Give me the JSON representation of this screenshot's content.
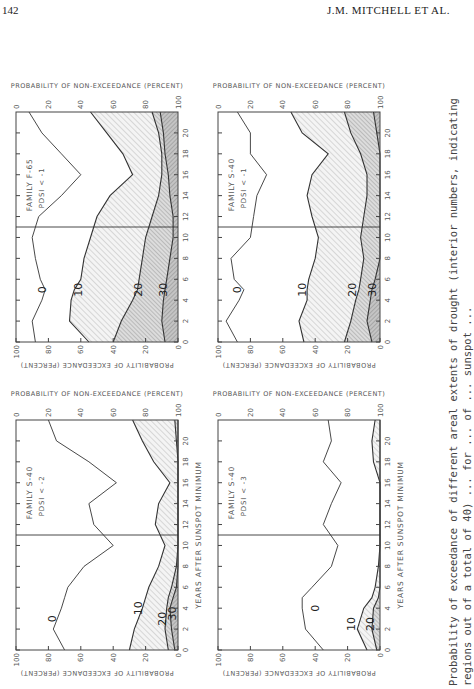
{
  "page": {
    "number": "142",
    "running_head": "J.M. MITCHELL ET AL."
  },
  "caption": {
    "line1": "Probability of exceedance of different areal extents of drought (interior numbers, indicating",
    "line2": "regions out of a total of 40) ... for ... of ... sunspot ..."
  },
  "axes": {
    "x_label": "YEARS AFTER SUNSPOT MINIMUM",
    "y_left_label": "PROBABILITY OF EXCEEDANCE (PERCENT)",
    "y_right_label": "PROBABILITY OF NON-EXCEEDANCE (PERCENT)"
  },
  "chart_data": [
    {
      "type": "area",
      "title": "FAMILY F-65",
      "subtitle": "PDSI < -1",
      "position": "top-left",
      "xlabel": "YEARS AFTER SUNSPOT MINIMUM",
      "ylabel": "PROBABILITY OF EXCEEDANCE (PERCENT)",
      "y2label": "PROBABILITY OF NON-EXCEEDANCE (PERCENT)",
      "xlim": [
        0,
        22
      ],
      "ylim": [
        0,
        100
      ],
      "xticks": [
        0,
        2,
        4,
        6,
        8,
        10,
        12,
        14,
        16,
        18,
        20
      ],
      "yticks": [
        0,
        20,
        40,
        60,
        80,
        100
      ],
      "vline_x": 11,
      "x": [
        0,
        2,
        4,
        5,
        6,
        8,
        10,
        12,
        14,
        16,
        18,
        20,
        22
      ],
      "series": [
        {
          "name": "0",
          "label_at": [
            5,
            84
          ],
          "values": [
            88,
            90,
            84,
            82,
            85,
            88,
            90,
            86,
            72,
            60,
            72,
            84,
            92
          ]
        },
        {
          "name": "10",
          "label_at": [
            5,
            62
          ],
          "values": [
            55,
            67,
            66,
            64,
            60,
            58,
            54,
            50,
            42,
            28,
            34,
            44,
            54
          ]
        },
        {
          "name": "20",
          "label_at": [
            5,
            25
          ],
          "values": [
            40,
            35,
            28,
            25,
            24,
            22,
            20,
            16,
            12,
            10,
            10,
            12,
            16
          ]
        },
        {
          "name": "30",
          "label_at": [
            5,
            9
          ],
          "values": [
            8,
            10,
            9,
            8,
            7,
            5,
            3,
            3,
            5,
            6,
            8,
            9,
            11
          ]
        }
      ]
    },
    {
      "type": "area",
      "title": "FAMILY S-40",
      "subtitle": "PDSI < -1",
      "position": "top-right",
      "xlabel": "YEARS AFTER SUNSPOT MINIMUM",
      "ylabel": "PROBABILITY OF EXCEEDANCE (PERCENT)",
      "y2label": "PROBABILITY OF NON-EXCEEDANCE (PERCENT)",
      "xlim": [
        0,
        22
      ],
      "ylim": [
        0,
        100
      ],
      "xticks": [
        0,
        2,
        4,
        6,
        8,
        10,
        12,
        14,
        16,
        18,
        20
      ],
      "yticks": [
        0,
        20,
        40,
        60,
        80,
        100
      ],
      "vline_x": 11,
      "x": [
        0,
        2,
        4,
        5,
        6,
        8,
        10,
        12,
        14,
        16,
        18,
        20,
        22
      ],
      "series": [
        {
          "name": "0",
          "label_at": [
            5,
            88
          ],
          "values": [
            88,
            95,
            87,
            84,
            90,
            92,
            80,
            78,
            76,
            70,
            80,
            80,
            88
          ]
        },
        {
          "name": "10",
          "label_at": [
            5,
            48
          ],
          "values": [
            47,
            50,
            45,
            45,
            44,
            40,
            38,
            42,
            45,
            42,
            32,
            48,
            55
          ]
        },
        {
          "name": "20",
          "label_at": [
            5,
            17
          ],
          "values": [
            22,
            18,
            15,
            13,
            12,
            10,
            12,
            10,
            8,
            8,
            12,
            18,
            22
          ]
        },
        {
          "name": "30",
          "label_at": [
            5,
            5
          ],
          "values": [
            5,
            8,
            6,
            5,
            3,
            0,
            0,
            0,
            0,
            0,
            0,
            2,
            4
          ]
        }
      ]
    },
    {
      "type": "area",
      "title": "FAMILY S-40",
      "subtitle": "PDSI < -2",
      "position": "bottom-left",
      "xlabel": "YEARS AFTER SUNSPOT MINIMUM",
      "ylabel": "PROBABILITY OF EXCEEDANCE (PERCENT)",
      "y2label": "PROBABILITY OF NON-EXCEEDANCE (PERCENT)",
      "xlim": [
        0,
        22
      ],
      "ylim": [
        0,
        100
      ],
      "xticks": [
        0,
        2,
        4,
        6,
        8,
        10,
        12,
        14,
        16,
        18,
        20
      ],
      "yticks": [
        0,
        20,
        40,
        60,
        80,
        100
      ],
      "vline_x": 11,
      "x": [
        0,
        2,
        4,
        5,
        6,
        8,
        10,
        12,
        14,
        16,
        18,
        20,
        22
      ],
      "series": [
        {
          "name": "0",
          "label_at": [
            3,
            78
          ],
          "values": [
            70,
            77,
            72,
            70,
            68,
            58,
            40,
            52,
            55,
            38,
            55,
            75,
            80
          ]
        },
        {
          "name": "10",
          "label_at": [
            4,
            25
          ],
          "values": [
            30,
            27,
            22,
            20,
            18,
            12,
            8,
            14,
            12,
            5,
            15,
            22,
            28
          ]
        },
        {
          "name": "20",
          "label_at": [
            3,
            10
          ],
          "values": [
            6,
            8,
            7,
            6,
            4,
            1,
            0,
            0,
            0,
            0,
            0,
            1,
            2
          ]
        },
        {
          "name": "30",
          "label_at": [
            3.5,
            4
          ],
          "values": [
            2,
            4,
            5,
            3,
            1,
            0,
            0,
            0,
            0,
            0,
            0,
            0,
            0
          ]
        }
      ]
    },
    {
      "type": "area",
      "title": "FAMILY S-40",
      "subtitle": "PDSI < -3",
      "position": "bottom-right",
      "xlabel": "YEARS AFTER SUNSPOT MINIMUM",
      "ylabel": "PROBABILITY OF EXCEEDANCE (PERCENT)",
      "y2label": "PROBABILITY OF NON-EXCEEDANCE (PERCENT)",
      "xlim": [
        0,
        22
      ],
      "ylim": [
        0,
        100
      ],
      "xticks": [
        0,
        2,
        4,
        6,
        8,
        10,
        12,
        14,
        16,
        18,
        20
      ],
      "yticks": [
        0,
        20,
        40,
        60,
        80,
        100
      ],
      "vline_x": 11,
      "x": [
        0,
        2,
        4,
        5,
        6,
        8,
        10,
        12,
        14,
        16,
        18,
        20,
        22
      ],
      "series": [
        {
          "name": "0",
          "label_at": [
            4,
            40
          ],
          "values": [
            35,
            46,
            48,
            48,
            42,
            30,
            26,
            35,
            30,
            24,
            35,
            30,
            32
          ]
        },
        {
          "name": "10",
          "label_at": [
            2.5,
            18
          ],
          "values": [
            8,
            14,
            10,
            5,
            3,
            1,
            0,
            0,
            0,
            0,
            4,
            5,
            3
          ]
        },
        {
          "name": "20",
          "label_at": [
            2.5,
            6
          ],
          "values": [
            2,
            5,
            4,
            1,
            0,
            0,
            0,
            0,
            0,
            0,
            0,
            0,
            0
          ]
        }
      ]
    }
  ]
}
